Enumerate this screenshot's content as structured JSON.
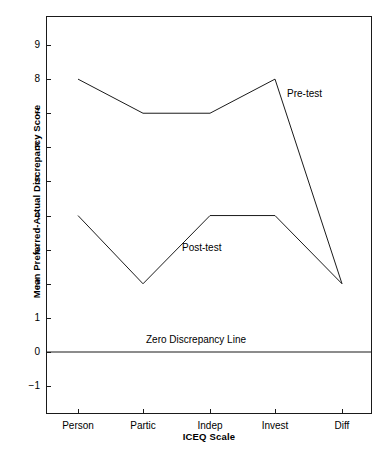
{
  "chart_data": {
    "type": "line",
    "title": "",
    "xlabel": "ICEQ Scale",
    "ylabel": "Mean Preferred-Actual Discrepancy Score",
    "categories": [
      "Person",
      "Partic",
      "Indep",
      "Invest",
      "Diff"
    ],
    "series": [
      {
        "name": "Pre-test",
        "values": [
          8,
          7,
          7,
          8,
          2
        ]
      },
      {
        "name": "Post-test",
        "values": [
          4,
          2,
          4,
          4,
          2
        ]
      }
    ],
    "ylim": [
      -1.5,
      9.6
    ],
    "yticks": [
      -1,
      0,
      1,
      2,
      3,
      4,
      5,
      6,
      7,
      8,
      9
    ],
    "ytick_labels": [
      "−1",
      "0",
      "1",
      "2",
      "3",
      "4",
      "5",
      "6",
      "7",
      "8",
      "9"
    ],
    "grid": false,
    "legend": "inline-annotations",
    "annotations": [
      {
        "name": "pre-test-label",
        "text": "Pre-test",
        "x_px": 287,
        "y_px": 88
      },
      {
        "name": "post-test-label",
        "text": "Post-test",
        "x_px": 182,
        "y_px": 242
      },
      {
        "name": "zero-line-label",
        "text": "Zero Discrepancy Line",
        "x_px": 196,
        "y_px": 334
      }
    ],
    "reference_lines": [
      {
        "name": "zero-discrepancy-line",
        "y": 0,
        "label": "Zero Discrepancy Line"
      }
    ],
    "colors": {
      "line": "#1a1a1a",
      "axis": "#1a1a1a",
      "background": "#ffffff",
      "text": "#000000"
    }
  }
}
